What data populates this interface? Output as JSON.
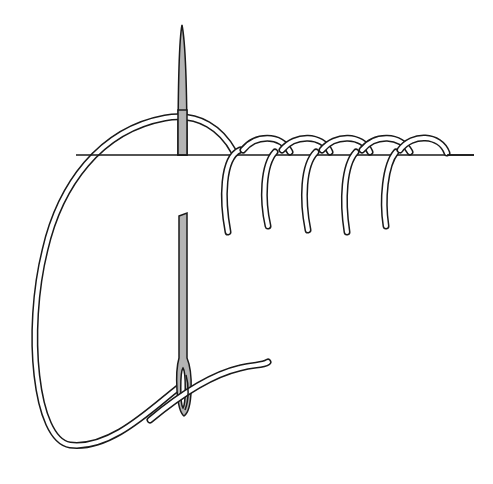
{
  "illustration": {
    "subject": "blanket stitch with needle and thread",
    "stitch_count": 5,
    "colors": {
      "line": "#1a1a1a",
      "thread_fill": "#ffffff",
      "needle_fill": "#b4b4b4",
      "background": "#ffffff"
    }
  }
}
